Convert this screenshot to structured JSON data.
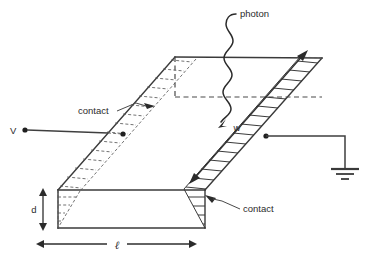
{
  "figure": {
    "title": "photoconductor-slab-diagram",
    "background_color": "#ffffff",
    "line_color": "#3a3a3a"
  },
  "labels": {
    "photon": "photon",
    "contact_left": "contact",
    "contact_right": "contact",
    "voltage_terminal": "V",
    "width": "w",
    "depth": "d",
    "length": "ℓ"
  },
  "dimensions": {
    "depth_symbol": "d",
    "length_symbol": "ℓ",
    "width_symbol": "w"
  },
  "icons": {
    "ground": "ground-symbol",
    "terminal_dot": "terminal-dot",
    "photon_wave": "photon-wave-arrow"
  }
}
